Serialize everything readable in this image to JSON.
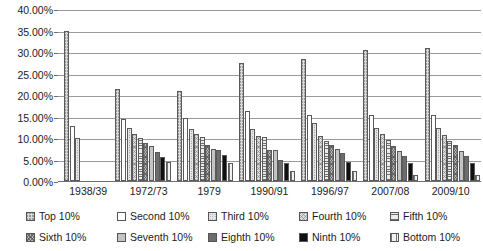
{
  "chart_data": {
    "type": "bar",
    "title": "",
    "subtitle": "",
    "xlabel": "",
    "ylabel": "",
    "ylim": [
      0,
      40
    ],
    "y_ticks": [
      "0.00%",
      "5.00%",
      "10.00%",
      "15.00%",
      "20.00%",
      "25.00%",
      "30.00%",
      "35.00%",
      "40.00%"
    ],
    "y_tick_values": [
      0,
      5,
      10,
      15,
      20,
      25,
      30,
      35,
      40
    ],
    "grid": true,
    "legend_position": "bottom",
    "categories": [
      "1938/39",
      "1972/73",
      "1979",
      "1990/91",
      "1996/97",
      "2007/08",
      "2009/10"
    ],
    "series": [
      {
        "name": "Top 10%",
        "values": [
          35.0,
          21.5,
          21.0,
          27.5,
          28.3,
          30.5,
          31.0
        ]
      },
      {
        "name": "Second 10%",
        "values": [
          12.8,
          14.4,
          14.7,
          16.3,
          15.4,
          15.3,
          15.3
        ]
      },
      {
        "name": "Third 10%",
        "values": [
          10.0,
          12.3,
          12.2,
          12.2,
          13.5,
          12.3,
          12.4
        ]
      },
      {
        "name": "Fourth 10%",
        "values": [
          null,
          10.9,
          11.0,
          10.5,
          10.4,
          11.0,
          10.7
        ]
      },
      {
        "name": "Fifth 10%",
        "values": [
          null,
          10.1,
          10.2,
          10.3,
          9.3,
          9.5,
          9.4
        ]
      },
      {
        "name": "Sixth 10%",
        "values": [
          null,
          8.9,
          8.3,
          7.3,
          8.4,
          8.2,
          8.4
        ]
      },
      {
        "name": "Seventh 10%",
        "values": [
          null,
          8.1,
          7.4,
          7.3,
          7.4,
          7.0,
          7.0
        ]
      },
      {
        "name": "Eighth 10%",
        "values": [
          null,
          6.8,
          7.1,
          5.0,
          6.4,
          5.9,
          5.9
        ]
      },
      {
        "name": "Ninth 10%",
        "values": [
          null,
          5.6,
          6.1,
          4.3,
          4.5,
          4.2,
          4.1
        ]
      },
      {
        "name": "Bottom 10%",
        "values": [
          null,
          4.5,
          4.2,
          2.4,
          2.4,
          1.4,
          1.4
        ]
      }
    ]
  },
  "legend": {
    "items": [
      {
        "label": "Top 10%",
        "pattern": "light-cross-hatch"
      },
      {
        "label": "Second 10%",
        "pattern": "white"
      },
      {
        "label": "Third 10%",
        "pattern": "fine-dots"
      },
      {
        "label": "Fourth 10%",
        "pattern": "light-diagonal-cross"
      },
      {
        "label": "Fifth 10%",
        "pattern": "horizontal-lines"
      },
      {
        "label": "Sixth 10%",
        "pattern": "dense-cross-hatch"
      },
      {
        "label": "Seventh 10%",
        "pattern": "solid-light-grey"
      },
      {
        "label": "Eighth 10%",
        "pattern": "solid-dark-grey"
      },
      {
        "label": "Ninth 10%",
        "pattern": "solid-black"
      },
      {
        "label": "Bottom 10%",
        "pattern": "vertical-lines"
      }
    ]
  },
  "colors": {
    "gridline": "#9a9a9a",
    "axis": "#6e6e6e",
    "text": "#1c1c1c",
    "bar_outline": "#5a5a5a"
  }
}
